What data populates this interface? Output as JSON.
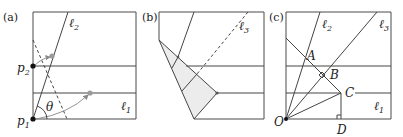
{
  "figure": {
    "panels": [
      {
        "id": "a",
        "label": "(a)",
        "points": {
          "p1": {
            "name": "p",
            "sub": "1"
          },
          "p2": {
            "name": "p",
            "sub": "2"
          }
        },
        "lines": {
          "l1": {
            "name": "ℓ",
            "sub": "1"
          },
          "l2": {
            "name": "ℓ",
            "sub": "2"
          }
        },
        "angle": "θ"
      },
      {
        "id": "b",
        "label": "(b)",
        "lines": {
          "l3": {
            "name": "ℓ",
            "sub": "3"
          }
        }
      },
      {
        "id": "c",
        "label": "(c)",
        "points": {
          "O": "O",
          "A": "A",
          "B": "B",
          "C": "C",
          "D": "D"
        },
        "lines": {
          "l1": {
            "name": "ℓ",
            "sub": "1"
          },
          "l2": {
            "name": "ℓ",
            "sub": "2"
          },
          "l3": {
            "name": "ℓ",
            "sub": "3"
          }
        }
      }
    ]
  },
  "colors": {
    "line": "#444444",
    "shade": "#ececec",
    "grey_dot": "#9a9a9a",
    "black_dot": "#111111"
  }
}
